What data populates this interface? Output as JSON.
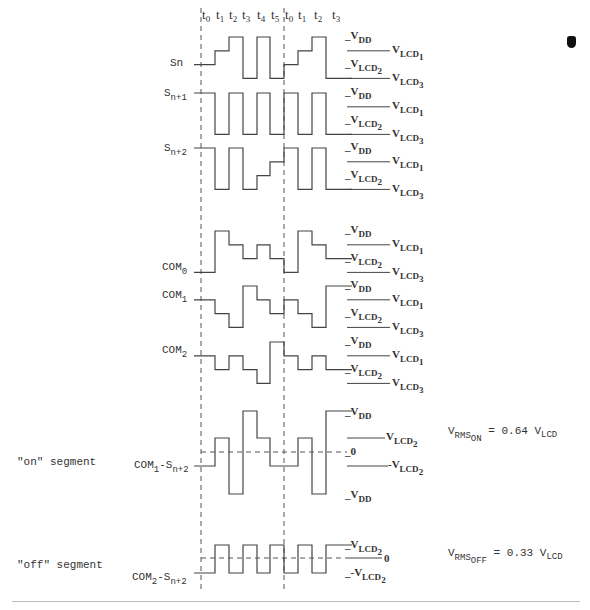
{
  "time_labels": {
    "frame1": [
      "t0",
      "t1",
      "t2",
      "t3",
      "t4",
      "t5"
    ],
    "frame2": [
      "t0",
      "t1",
      "t2",
      "t3"
    ]
  },
  "rows": [
    {
      "id": "sn",
      "label": "Sn",
      "levels": [
        "VLCD2",
        "VLCD1",
        "VDD",
        "VLCD3",
        "VDD",
        "VLCD3",
        "VLCD2",
        "VLCD1",
        "VDD",
        "VLCD3"
      ]
    },
    {
      "id": "sn1",
      "label": "S",
      "label_sub": "n+1",
      "levels": [
        "VDD",
        "VLCD3",
        "VDD",
        "VLCD3",
        "VDD",
        "VLCD3",
        "VDD",
        "VLCD3",
        "VDD",
        "VLCD3"
      ]
    },
    {
      "id": "sn2",
      "label": "S",
      "label_sub": "n+2",
      "levels": [
        "VDD",
        "VLCD3",
        "VDD",
        "VLCD3",
        "VLCD2",
        "VLCD1",
        "VDD",
        "VLCD3",
        "VDD",
        "VLCD3"
      ]
    },
    {
      "id": "com0",
      "label": "COM",
      "label_sub": "0",
      "levels": [
        "VLCD3",
        "VDD",
        "VLCD1",
        "VLCD2",
        "VLCD1",
        "VLCD2",
        "VLCD3",
        "VDD",
        "VLCD1",
        "VLCD2"
      ]
    },
    {
      "id": "com1",
      "label": "COM",
      "label_sub": "1",
      "levels": [
        "VLCD1",
        "VLCD2",
        "VLCD3",
        "VDD",
        "VLCD1",
        "VLCD2",
        "VLCD1",
        "VLCD2",
        "VLCD3",
        "VDD"
      ]
    },
    {
      "id": "com2",
      "label": "COM",
      "label_sub": "2",
      "levels": [
        "VLCD1",
        "VLCD2",
        "VLCD1",
        "VLCD2",
        "VLCD3",
        "VDD",
        "VLCD1",
        "VLCD2",
        "VLCD1",
        "VLCD2"
      ]
    }
  ],
  "level_labels": {
    "vdd": "V",
    "vdd_sub": "DD",
    "vlcd1": "V",
    "vlcd1_sub": "LCD",
    "vlcd1_idx": "1",
    "vlcd2": "V",
    "vlcd2_sub": "LCD",
    "vlcd2_idx": "2",
    "vlcd3": "V",
    "vlcd3_sub": "LCD",
    "vlcd3_idx": "3"
  },
  "on_segment": {
    "side_label": "\"on\" segment",
    "trace_label": "COM",
    "trace_sub1": "1",
    "trace_mid": "-S",
    "trace_sub2": "n+2",
    "levels": [
      "-VLCD2",
      "VLCD2",
      "-VDD",
      "VDD",
      "VLCD2",
      "-VLCD2",
      "-VLCD2",
      "VLCD2",
      "-VDD",
      "VDD"
    ],
    "right_labels": {
      "top": "V",
      "top_sub": "DD",
      "vlcd2": "V",
      "vlcd2_sub": "LCD",
      "vlcd2_idx": "2",
      "zero": "0",
      "neg_vlcd2": "-V",
      "neg_vlcd2_sub": "LCD",
      "neg_vlcd2_idx": "2",
      "bottom": "V",
      "bottom_sub": "DD"
    },
    "rms": {
      "v": "V",
      "sub": "RMS",
      "subsub": "ON",
      "eq": "= 0.64 V",
      "eq_sub": "LCD"
    }
  },
  "off_segment": {
    "side_label": "\"off\" segment",
    "trace_label": "COM",
    "trace_sub1": "2",
    "trace_mid": "-S",
    "trace_sub2": "n+2",
    "levels": [
      "low",
      "high",
      "low",
      "high",
      "low",
      "high",
      "low",
      "high",
      "low",
      "high"
    ],
    "right_labels": {
      "top": "V",
      "top_sub": "LCD",
      "top_idx": "2",
      "zero": "0",
      "bottom": "-V",
      "bottom_sub": "LCD",
      "bottom_idx": "2"
    },
    "rms": {
      "v": "V",
      "sub": "RMS",
      "subsub": "OFF",
      "eq": "= 0.33 V",
      "eq_sub": "LCD"
    }
  },
  "caption": ""
}
